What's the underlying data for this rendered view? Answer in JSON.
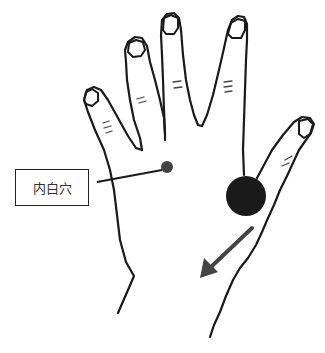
{
  "diagram": {
    "labels": [
      {
        "id": "neibai-point",
        "text": "内白穴"
      }
    ],
    "points": [
      {
        "name": "neibai-point",
        "cx": 167,
        "cy": 167,
        "r": 6,
        "color": "#444444"
      },
      {
        "name": "large-pressure-point",
        "cx": 246,
        "cy": 196,
        "r": 20,
        "color": "#1a1a1a"
      }
    ],
    "arrow": {
      "from": [
        252,
        228
      ],
      "to": [
        200,
        278
      ],
      "color": "#444444",
      "meaning": "direction"
    },
    "colors": {
      "line": "#1a1a1a",
      "background": "#ffffff"
    }
  }
}
